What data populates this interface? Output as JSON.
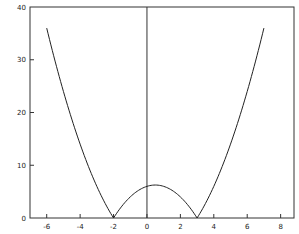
{
  "chart_data": {
    "type": "line",
    "title": "",
    "xlabel": "",
    "ylabel": "",
    "function": "|(x+2)(x-3)|",
    "xlim": [
      -7,
      8.8
    ],
    "ylim": [
      0,
      40
    ],
    "grid": false,
    "legend": null,
    "x_ticks": [
      -6,
      -4,
      -2,
      0,
      2,
      4,
      6,
      8
    ],
    "x_tick_labels": [
      "-6",
      "-4",
      "-2",
      "0",
      "2",
      "4",
      "6",
      "8"
    ],
    "y_ticks": [
      0,
      10,
      20,
      30,
      40
    ],
    "y_tick_labels": [
      "0",
      "10",
      "20",
      "30",
      "40"
    ],
    "vertical_line_x": 0,
    "series": [
      {
        "name": "y",
        "color": "#222222",
        "x": [
          -6,
          -5.5,
          -5,
          -4.5,
          -4,
          -3.5,
          -3,
          -2.5,
          -2,
          -1.5,
          -1,
          -0.5,
          0,
          0.5,
          1,
          1.5,
          2,
          2.5,
          3,
          3.5,
          4,
          4.5,
          5,
          5.5,
          6,
          6.5,
          7
        ],
        "values": [
          36,
          30.75,
          24,
          19.25,
          14,
          9.75,
          6,
          2.75,
          0,
          2.25,
          4,
          5.25,
          6,
          6.25,
          6,
          5.25,
          4,
          2.25,
          0,
          2.75,
          6,
          9.75,
          14,
          19.25,
          24,
          30.75,
          36
        ]
      }
    ],
    "annotations": []
  }
}
